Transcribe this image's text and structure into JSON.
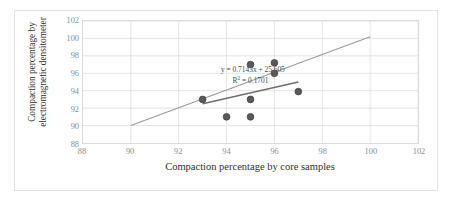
{
  "chart_data": {
    "type": "scatter",
    "title": "",
    "xlabel": "Compaction percentage by core samples",
    "ylabel": "Compaction percentage by\nelectromagnetic densitometer",
    "xlim": [
      88,
      102
    ],
    "ylim": [
      88,
      102
    ],
    "xticks": [
      88,
      90,
      92,
      94,
      96,
      98,
      100,
      102
    ],
    "yticks": [
      88,
      90,
      92,
      94,
      96,
      98,
      100,
      102
    ],
    "grid": true,
    "legend": "none",
    "points": [
      {
        "x": 93,
        "y": 93
      },
      {
        "x": 94,
        "y": 91
      },
      {
        "x": 95,
        "y": 97
      },
      {
        "x": 95,
        "y": 93
      },
      {
        "x": 95,
        "y": 91
      },
      {
        "x": 96,
        "y": 97.2
      },
      {
        "x": 96,
        "y": 96
      },
      {
        "x": 97,
        "y": 93.9
      }
    ],
    "marker_color": "#595959",
    "series": [
      {
        "name": "trendline-main",
        "type": "line",
        "color": "#9a9a9a",
        "x": [
          90,
          100
        ],
        "y": [
          90,
          100.2
        ]
      },
      {
        "name": "trendline-secondary",
        "type": "line",
        "color": "#6e6e6e",
        "x": [
          93,
          97
        ],
        "y": [
          92.5,
          95.0
        ]
      }
    ],
    "annotations": [
      {
        "name": "regression-equation",
        "text": "y = 0.7143x + 25.605",
        "x": 95.1,
        "y": 96.1
      },
      {
        "name": "r-squared",
        "text": "R² = 0.1701",
        "x": 95.0,
        "y": 94.9
      }
    ],
    "equation_label": "y = 0.7143x + 25.605",
    "r_squared_prefix": "R",
    "r_squared_sup": "2",
    "r_squared_value": " = 0.1701"
  }
}
